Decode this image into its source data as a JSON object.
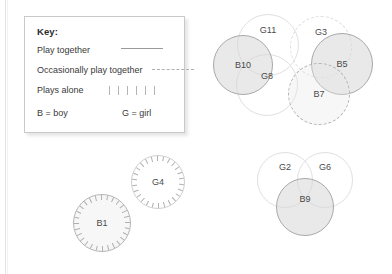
{
  "page": {
    "background_color": "#ffffff",
    "edge_rule_color": "#e3e3e3"
  },
  "key": {
    "title": "Key:",
    "rows": [
      {
        "label": "Play together",
        "sample": "solid-line"
      },
      {
        "label": "Occasionally play together",
        "sample": "dashed-line"
      },
      {
        "label": "Plays alone",
        "sample": "tick-marks"
      }
    ],
    "row1_label": "Play together",
    "row2_label": "Occasionally play together",
    "row3_label": "Plays alone",
    "boy_legend": "B = boy",
    "girl_legend": "G = girl"
  },
  "diagram": {
    "colors": {
      "line": "#a9a9a9",
      "faint_line": "#e0e0e0",
      "fill_grey": "#d7d7d7",
      "label": "#4a4a4a"
    },
    "clusters": [
      {
        "name": "upper-right-group",
        "nodes": [
          {
            "id": "G11",
            "label": "G11",
            "style": "faint-line",
            "fill": "fill-none"
          },
          {
            "id": "G3",
            "label": "G3",
            "style": "dashed-line",
            "fill": "fill-none"
          },
          {
            "id": "B10",
            "label": "B10",
            "style": "solid-line",
            "fill": "fill-grey"
          },
          {
            "id": "B5",
            "label": "B5",
            "style": "solid-line",
            "fill": "fill-grey"
          },
          {
            "id": "G8",
            "label": "G8",
            "style": "faint-line",
            "fill": "fill-none"
          },
          {
            "id": "B7",
            "label": "B7",
            "style": "dashed-line",
            "fill": "fill-light"
          }
        ]
      },
      {
        "name": "lower-right-group",
        "nodes": [
          {
            "id": "G2",
            "label": "G2",
            "style": "faint-line",
            "fill": "fill-none"
          },
          {
            "id": "G6",
            "label": "G6",
            "style": "faint-line",
            "fill": "fill-none"
          },
          {
            "id": "B9",
            "label": "B9",
            "style": "solid-line",
            "fill": "fill-grey"
          }
        ]
      },
      {
        "name": "lower-left-group",
        "nodes": [
          {
            "id": "G4",
            "label": "G4",
            "style": "alone",
            "fill": "fill-none"
          },
          {
            "id": "B1",
            "label": "B1",
            "style": "alone",
            "fill": "fill-light"
          }
        ]
      }
    ],
    "labels": {
      "G11": "G11",
      "G3": "G3",
      "B10": "B10",
      "B5": "B5",
      "G8": "G8",
      "B7": "B7",
      "G2": "G2",
      "G6": "G6",
      "B9": "B9",
      "G4": "G4",
      "B1": "B1"
    }
  }
}
